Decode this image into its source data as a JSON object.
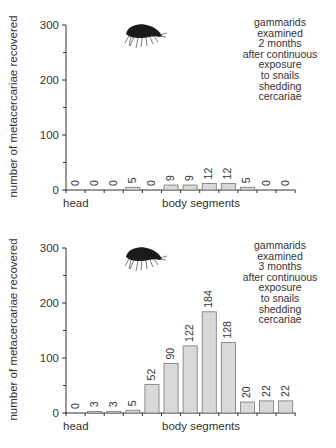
{
  "chart_data": [
    {
      "type": "bar",
      "title": "",
      "annotation": [
        "gammarids",
        "examined",
        "2 months",
        "after continuous",
        "exposure",
        "to snails",
        "shedding",
        "cercariae"
      ],
      "xlabel_left": "head",
      "xlabel": "body segments",
      "ylabel": "number of metacercariae recovered",
      "ylim": [
        0,
        300
      ],
      "yticks": [
        0,
        100,
        200,
        300
      ],
      "categories": [
        "head",
        "2",
        "3",
        "4",
        "5",
        "6",
        "7",
        "8",
        "9",
        "10",
        "11",
        "12"
      ],
      "values": [
        0,
        0,
        0,
        5,
        0,
        9,
        9,
        12,
        12,
        5,
        0,
        0
      ],
      "bar_color": "#d9d9d9",
      "grid": false
    },
    {
      "type": "bar",
      "title": "",
      "annotation": [
        "gammarids",
        "examined",
        "3 months",
        "after continuous",
        "exposure",
        "to snails",
        "shedding",
        "cercariae"
      ],
      "xlabel_left": "head",
      "xlabel": "body segments",
      "ylabel": "number of metacercariae recovered",
      "ylim": [
        0,
        300
      ],
      "yticks": [
        0,
        100,
        200,
        300
      ],
      "categories": [
        "head",
        "2",
        "3",
        "4",
        "5",
        "6",
        "7",
        "8",
        "9",
        "10",
        "11",
        "12"
      ],
      "values": [
        0,
        3,
        3,
        5,
        52,
        90,
        122,
        184,
        128,
        20,
        22,
        22
      ],
      "bar_color": "#d9d9d9",
      "grid": false
    }
  ],
  "icons": [
    "gammarid-amphipod-icon"
  ]
}
